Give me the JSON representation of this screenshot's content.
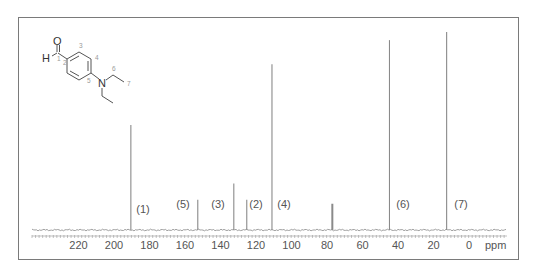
{
  "chart_data": {
    "type": "bar",
    "subtype": "13C NMR stick spectrum",
    "title": "",
    "xlabel": "ppm",
    "ylabel": "",
    "xlim": [
      235,
      -5
    ],
    "x_reversed": true,
    "grid": false,
    "legend": null,
    "x_ticks": [
      220,
      200,
      180,
      160,
      140,
      120,
      100,
      80,
      60,
      40,
      20,
      0
    ],
    "x_tick_labels": [
      "220",
      "200",
      "180",
      "160",
      "140",
      "120",
      "100",
      "80",
      "60",
      "40",
      "20",
      "0"
    ],
    "axis_unit_label": "ppm",
    "peaks": [
      {
        "label": "(1)",
        "ppm": 190.5,
        "height": 0.52,
        "assignment": "C1 (CHO)"
      },
      {
        "label": "(5)",
        "ppm": 152.8,
        "height": 0.15,
        "assignment": "C5"
      },
      {
        "label": "(3)",
        "ppm": 132.5,
        "height": 0.23,
        "assignment": "C3"
      },
      {
        "label": "(2)",
        "ppm": 125.2,
        "height": 0.15,
        "assignment": "C2"
      },
      {
        "label": "(4)",
        "ppm": 111.0,
        "height": 0.82,
        "assignment": "C4"
      },
      {
        "label": "",
        "ppm": 77.0,
        "height": 0.13,
        "assignment": "CDCl3 solvent",
        "width": 2
      },
      {
        "label": "(6)",
        "ppm": 44.8,
        "height": 0.94,
        "assignment": "C6 (NCH2)"
      },
      {
        "label": "(7)",
        "ppm": 12.6,
        "height": 0.98,
        "assignment": "C7 (CH3)"
      }
    ],
    "peak_label_positions": [
      {
        "label": "(1)",
        "x": 143,
        "y": 213
      },
      {
        "label": "(5)",
        "x": 183,
        "y": 208
      },
      {
        "label": "(3)",
        "x": 218,
        "y": 208
      },
      {
        "label": "(2)",
        "x": 256,
        "y": 208
      },
      {
        "label": "(4)",
        "x": 284,
        "y": 208
      },
      {
        "label": "(6)",
        "x": 403,
        "y": 208
      },
      {
        "label": "(7)",
        "x": 461,
        "y": 208
      }
    ]
  },
  "molecule": {
    "name": "4-(diethylamino)benzaldehyde",
    "atoms": {
      "O": "O",
      "H": "H",
      "N": "N"
    },
    "position_numbers": [
      "1",
      "2",
      "3",
      "4",
      "5",
      "6",
      "7"
    ]
  }
}
